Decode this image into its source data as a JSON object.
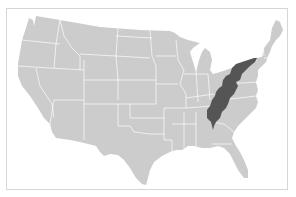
{
  "map": {
    "title": "Appalachian Region",
    "subject": "Contiguous United States",
    "highlighted_region": "Appalachian Region",
    "colors": {
      "background": "#ffffff",
      "frame_border": "#d6d6d6",
      "land": "#cccccc",
      "state_borders": "#ffffff",
      "highlight": "#555555"
    }
  }
}
